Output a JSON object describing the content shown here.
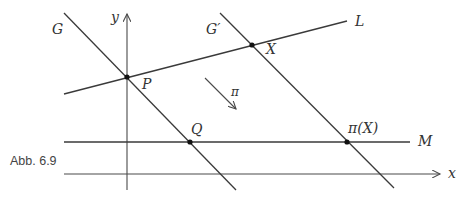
{
  "figure": {
    "caption": "Abb. 6.9",
    "axes": {
      "x_label": "x",
      "y_label": "y"
    },
    "lines": {
      "G": "G",
      "G_prime": "G′",
      "L": "L",
      "M": "M"
    },
    "points": {
      "P": "P",
      "X": "X",
      "Q": "Q",
      "pi_X": "π(X)"
    },
    "projection_label": "π",
    "colors": {
      "line": "#3a3a3a",
      "text": "#333333",
      "background": "#ffffff"
    }
  }
}
